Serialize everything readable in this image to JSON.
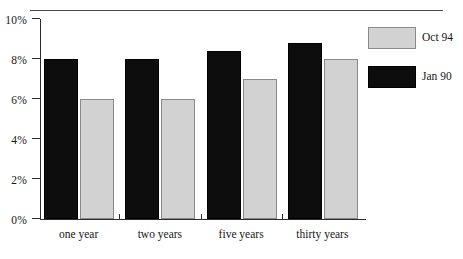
{
  "chart_data": {
    "type": "bar",
    "title": "",
    "subtitle": "",
    "xlabel": "",
    "ylabel": "",
    "categories": [
      "one year",
      "two years",
      "five years",
      "thirty years"
    ],
    "series": [
      {
        "name": "Jan 90",
        "color": "#0d0d0d",
        "values": [
          8.0,
          8.0,
          8.4,
          8.8
        ]
      },
      {
        "name": "Oct 94",
        "color": "#d2d2d2",
        "values": [
          6.0,
          6.0,
          7.0,
          8.0
        ]
      }
    ],
    "ylim": [
      0,
      10
    ],
    "yticks": [
      0,
      2,
      4,
      6,
      8,
      10
    ],
    "ytick_labels": [
      "0%",
      "2%",
      "4%",
      "6%",
      "8%",
      "10%"
    ],
    "grid": false,
    "legend_position": "right-top",
    "legend_entries": [
      {
        "label": "Oct  94",
        "swatch": "gray"
      },
      {
        "label": "Jan  90",
        "swatch": "black"
      }
    ]
  },
  "axis": {
    "y_tick_labels": [
      "10%",
      "8%",
      "6%",
      "4%",
      "2%",
      "0%"
    ],
    "x_group_labels": [
      "one year",
      "two years",
      "five years",
      "thirty years"
    ]
  },
  "legend": {
    "rows": [
      {
        "label": "Oct  94"
      },
      {
        "label": "Jan  90"
      }
    ]
  },
  "colors": {
    "series_jan90": "#0d0d0d",
    "series_oct94": "#d2d2d2",
    "axis": "#2b2b2b",
    "rule": "#4b4b4b",
    "background": "#ffffff"
  }
}
